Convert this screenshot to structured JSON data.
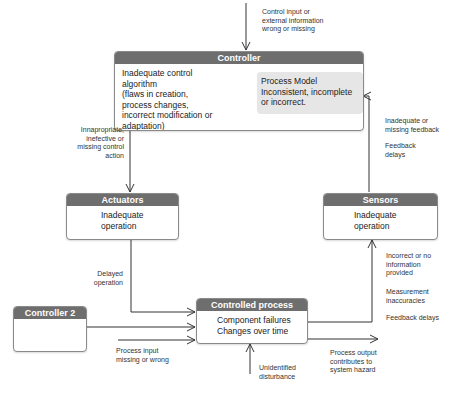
{
  "diagram": {
    "type": "control-loop",
    "colors": {
      "header": "#6e6e6e",
      "border": "#8a8a8a",
      "process_model_bg": "#e6e6e6",
      "line": "#333333"
    }
  },
  "controller": {
    "title": "Controller",
    "body": "Inadequate control\nalgorithm\n(flaws in creation,\nprocess changes,\nincorrect modification or\nadaptation)",
    "process_model": "Process Model\nInconsistent, incomplete\nor incorrect."
  },
  "actuators": {
    "title": "Actuators",
    "body": "Inadequate\noperation"
  },
  "sensors": {
    "title": "Sensors",
    "body": "Inadequate\noperation"
  },
  "controlled_process": {
    "title": "Controlled process",
    "body": "Component failures\nChanges over time"
  },
  "controller2": {
    "title": "Controller 2",
    "body": ""
  },
  "labels": {
    "control_input": "Control input or\nexternal information\nwrong or missing",
    "control_action": "Innapropriate,\ninefective or\nmissing control\naction",
    "feedback": "Inadequate or\nmissing feedback",
    "feedback_delays_top": "Feedback\ndelays",
    "delayed_operation": "Delayed\noperation",
    "incorrect_info": "Incorrect or no\ninformation\nprovided",
    "measurement": "Measurement\ninaccuracies",
    "feedback_delays_bottom": "Feedback delays",
    "process_input": "Process input\nmissing or wrong",
    "disturbance": "Unidentified\ndisturbance",
    "process_output": "Process output\ncontributes to\nsystem hazard"
  }
}
